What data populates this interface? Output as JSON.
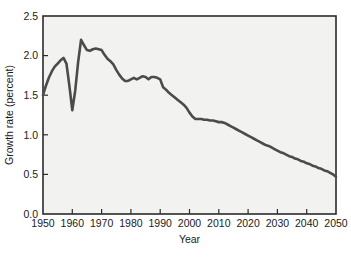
{
  "chart_data": {
    "type": "line",
    "title": "",
    "xlabel": "Year",
    "ylabel": "Growth rate (percent)",
    "xlim": [
      1950,
      2050
    ],
    "ylim": [
      0.0,
      2.5
    ],
    "xticks": [
      1950,
      1960,
      1970,
      1980,
      1990,
      2000,
      2010,
      2020,
      2030,
      2040,
      2050
    ],
    "xtick_labels": [
      "1950",
      "1960",
      "1970",
      "1980",
      "1990",
      "2000",
      "2010",
      "2020",
      "2030",
      "2040",
      "2050"
    ],
    "yticks": [
      0.0,
      0.5,
      1.0,
      1.5,
      2.0,
      2.5
    ],
    "ytick_labels": [
      "0.0",
      "0.5",
      "1.0",
      "1.5",
      "2.0",
      "2.5"
    ],
    "grid": false,
    "legend": "none",
    "line_color": "#4b4b4b",
    "plot_bg_color": "#f2f2f0",
    "page_bg_color": "#ffffff",
    "series": [
      {
        "name": "World population growth rate",
        "x": [
          1950,
          1951,
          1952,
          1953,
          1954,
          1955,
          1956,
          1957,
          1958,
          1959,
          1960,
          1961,
          1962,
          1963,
          1964,
          1965,
          1966,
          1967,
          1968,
          1969,
          1970,
          1971,
          1972,
          1973,
          1974,
          1975,
          1976,
          1977,
          1978,
          1979,
          1980,
          1981,
          1982,
          1983,
          1984,
          1985,
          1986,
          1987,
          1988,
          1989,
          1990,
          1991,
          1992,
          1993,
          1994,
          1995,
          1996,
          1997,
          1998,
          1999,
          2000,
          2001,
          2002,
          2003,
          2004,
          2005,
          2006,
          2007,
          2008,
          2009,
          2010,
          2011,
          2012,
          2013,
          2014,
          2015,
          2016,
          2017,
          2018,
          2019,
          2020,
          2021,
          2022,
          2023,
          2024,
          2025,
          2026,
          2027,
          2028,
          2029,
          2030,
          2031,
          2032,
          2033,
          2034,
          2035,
          2036,
          2037,
          2038,
          2039,
          2040,
          2041,
          2042,
          2043,
          2044,
          2045,
          2046,
          2047,
          2048,
          2049,
          2050
        ],
        "y": [
          1.5,
          1.62,
          1.72,
          1.8,
          1.86,
          1.9,
          1.94,
          1.97,
          1.9,
          1.62,
          1.31,
          1.56,
          1.92,
          2.2,
          2.13,
          2.07,
          2.06,
          2.08,
          2.09,
          2.08,
          2.07,
          2.01,
          1.96,
          1.93,
          1.89,
          1.82,
          1.76,
          1.71,
          1.68,
          1.68,
          1.7,
          1.72,
          1.7,
          1.72,
          1.74,
          1.73,
          1.7,
          1.73,
          1.73,
          1.72,
          1.7,
          1.6,
          1.57,
          1.53,
          1.5,
          1.47,
          1.44,
          1.41,
          1.38,
          1.34,
          1.28,
          1.23,
          1.2,
          1.2,
          1.2,
          1.19,
          1.19,
          1.18,
          1.18,
          1.17,
          1.16,
          1.16,
          1.15,
          1.13,
          1.11,
          1.09,
          1.07,
          1.05,
          1.03,
          1.01,
          0.99,
          0.97,
          0.95,
          0.93,
          0.91,
          0.89,
          0.87,
          0.86,
          0.84,
          0.82,
          0.8,
          0.78,
          0.77,
          0.75,
          0.73,
          0.72,
          0.7,
          0.69,
          0.67,
          0.66,
          0.64,
          0.63,
          0.61,
          0.6,
          0.58,
          0.57,
          0.55,
          0.54,
          0.52,
          0.5,
          0.47
        ]
      }
    ]
  }
}
